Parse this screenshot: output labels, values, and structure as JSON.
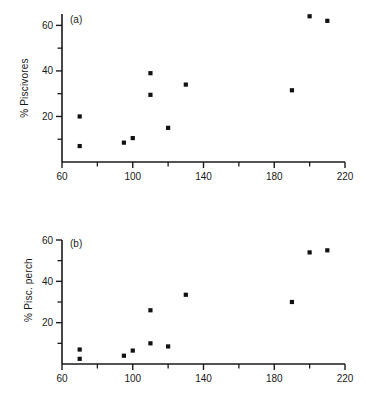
{
  "chart_data": [
    {
      "type": "scatter",
      "panel_label": "(a)",
      "title": "",
      "xlabel": "",
      "ylabel": "% Piscivores",
      "xlim": [
        60,
        220
      ],
      "ylim": [
        0,
        65
      ],
      "grid": false,
      "legend": null,
      "x_major_ticks": [
        60,
        100,
        140,
        180,
        220
      ],
      "x_minor_ticks": [
        80,
        120,
        160,
        200
      ],
      "x_ticklabels": [
        "60",
        "100",
        "140",
        "180",
        "220"
      ],
      "y_major_ticks": [
        20,
        40,
        60
      ],
      "y_minor_ticks": [
        10,
        30,
        50
      ],
      "y_ticklabels": [
        "20",
        "40",
        "60"
      ],
      "marker": "square",
      "marker_color": "#111111",
      "points": [
        {
          "x": 70,
          "y": 20
        },
        {
          "x": 70,
          "y": 7
        },
        {
          "x": 95,
          "y": 8.5
        },
        {
          "x": 100,
          "y": 10.5
        },
        {
          "x": 110,
          "y": 39
        },
        {
          "x": 110,
          "y": 29.5
        },
        {
          "x": 120,
          "y": 15
        },
        {
          "x": 130,
          "y": 34
        },
        {
          "x": 190,
          "y": 31.5
        },
        {
          "x": 200,
          "y": 64
        },
        {
          "x": 210,
          "y": 62
        }
      ]
    },
    {
      "type": "scatter",
      "panel_label": "(b)",
      "title": "",
      "xlabel": "",
      "ylabel": "% Pisc. perch",
      "xlim": [
        60,
        220
      ],
      "ylim": [
        0,
        60
      ],
      "grid": false,
      "legend": null,
      "x_major_ticks": [
        60,
        100,
        140,
        180,
        220
      ],
      "x_minor_ticks": [
        80,
        120,
        160,
        200
      ],
      "x_ticklabels": [
        "60",
        "100",
        "140",
        "180",
        "220"
      ],
      "y_major_ticks": [
        20,
        40,
        60
      ],
      "y_minor_ticks": [
        10,
        30,
        50
      ],
      "y_ticklabels": [
        "20",
        "40",
        "60"
      ],
      "marker": "square",
      "marker_color": "#111111",
      "points": [
        {
          "x": 70,
          "y": 7
        },
        {
          "x": 70,
          "y": 2.5
        },
        {
          "x": 95,
          "y": 4
        },
        {
          "x": 100,
          "y": 6.5
        },
        {
          "x": 110,
          "y": 26
        },
        {
          "x": 110,
          "y": 10
        },
        {
          "x": 120,
          "y": 8.5
        },
        {
          "x": 130,
          "y": 33.5
        },
        {
          "x": 190,
          "y": 30
        },
        {
          "x": 200,
          "y": 54
        },
        {
          "x": 210,
          "y": 55
        }
      ]
    }
  ]
}
